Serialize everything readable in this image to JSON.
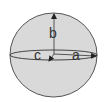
{
  "diagram": {
    "labels": {
      "a": "a",
      "b": "b",
      "c": "c"
    },
    "colors": {
      "fill": "#d9d9d9",
      "outline": "#555555",
      "axis": "#222222",
      "background": "#ffffff"
    }
  }
}
